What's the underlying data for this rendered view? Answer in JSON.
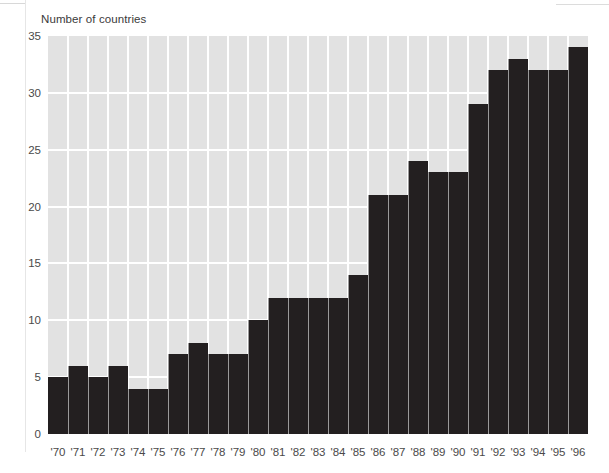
{
  "chart_data": {
    "type": "bar",
    "title": "Number of countries",
    "xlabel": "",
    "ylabel": "Number of countries",
    "ylim": [
      0,
      35
    ],
    "ytick_step": 5,
    "yticks": [
      0,
      5,
      10,
      15,
      20,
      25,
      30,
      35
    ],
    "ytick_labels": [
      "0",
      "5",
      "10",
      "15",
      "20",
      "25",
      "30",
      "35"
    ],
    "grid": true,
    "legend": false,
    "legend_position": "none",
    "categories": [
      "'70",
      "'71",
      "'72",
      "'73",
      "'74",
      "'75",
      "'76",
      "'77",
      "'78",
      "'79",
      "'80",
      "'81",
      "'82",
      "'83",
      "'84",
      "'85",
      "'86",
      "'87",
      "'88",
      "'89",
      "'90",
      "'91",
      "'92",
      "'93",
      "'94",
      "'95",
      "'96"
    ],
    "values": [
      5,
      6,
      5,
      6,
      4,
      4,
      7,
      8,
      7,
      7,
      10,
      12,
      12,
      12,
      12,
      14,
      21,
      21,
      24,
      23,
      23,
      29,
      32,
      33,
      32,
      32,
      34
    ],
    "bar_color": "#231f20",
    "plot_background": "#e2e2e2",
    "gridline_color": "#ffffff",
    "page_background": "#ffffff",
    "axis_label_color": "#4a4a4a"
  }
}
